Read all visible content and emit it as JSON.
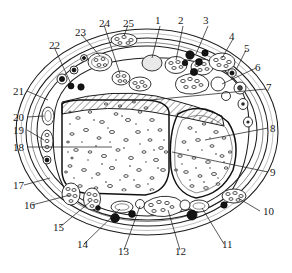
{
  "figure": {
    "kind": "anatomical-cross-section",
    "label_count": 25,
    "background_color": "#ffffff",
    "ink_color": "#1d1d1d"
  },
  "labels": [
    {
      "id": "1",
      "text": "1",
      "x": 155,
      "y": 15
    },
    {
      "id": "2",
      "text": "2",
      "x": 178,
      "y": 15
    },
    {
      "id": "3",
      "text": "3",
      "x": 203,
      "y": 15
    },
    {
      "id": "4",
      "text": "4",
      "x": 229,
      "y": 31
    },
    {
      "id": "5",
      "text": "5",
      "x": 244,
      "y": 43
    },
    {
      "id": "6",
      "text": "6",
      "x": 255,
      "y": 62
    },
    {
      "id": "7",
      "text": "7",
      "x": 266,
      "y": 82
    },
    {
      "id": "8",
      "text": "8",
      "x": 270,
      "y": 123
    },
    {
      "id": "9",
      "text": "9",
      "x": 270,
      "y": 167
    },
    {
      "id": "10",
      "text": "10",
      "x": 263,
      "y": 206
    },
    {
      "id": "11",
      "text": "11",
      "x": 222,
      "y": 239
    },
    {
      "id": "12",
      "text": "12",
      "x": 175,
      "y": 246
    },
    {
      "id": "13",
      "text": "13",
      "x": 118,
      "y": 246
    },
    {
      "id": "14",
      "text": "14",
      "x": 77,
      "y": 239
    },
    {
      "id": "15",
      "text": "15",
      "x": 53,
      "y": 222
    },
    {
      "id": "16",
      "text": "16",
      "x": 24,
      "y": 200
    },
    {
      "id": "17",
      "text": "17",
      "x": 13,
      "y": 180
    },
    {
      "id": "18",
      "text": "18",
      "x": 13,
      "y": 142
    },
    {
      "id": "19",
      "text": "19",
      "x": 13,
      "y": 125
    },
    {
      "id": "20",
      "text": "20",
      "x": 13,
      "y": 112
    },
    {
      "id": "21",
      "text": "21",
      "x": 13,
      "y": 86
    },
    {
      "id": "22",
      "text": "22",
      "x": 49,
      "y": 40
    },
    {
      "id": "23",
      "text": "23",
      "x": 75,
      "y": 27
    },
    {
      "id": "24",
      "text": "24",
      "x": 99,
      "y": 18
    },
    {
      "id": "25",
      "text": "25",
      "x": 123,
      "y": 18
    }
  ],
  "structures": {
    "outer_skin_ring": "skin-outline",
    "subcutaneous_ring": "subcutaneous-fat-layer",
    "deep_fascia_ring": "deep-fascia",
    "main_bone": "bone-cortex-and-marrow",
    "second_bone": "accessory-bone",
    "hatched_band": "interosseous-membrane-hatched",
    "muscle_bellies": "muscle-fascicle-bundles",
    "vessels_dark": "blood-vessel-lumen",
    "vessels_open": "vein-lumen"
  }
}
